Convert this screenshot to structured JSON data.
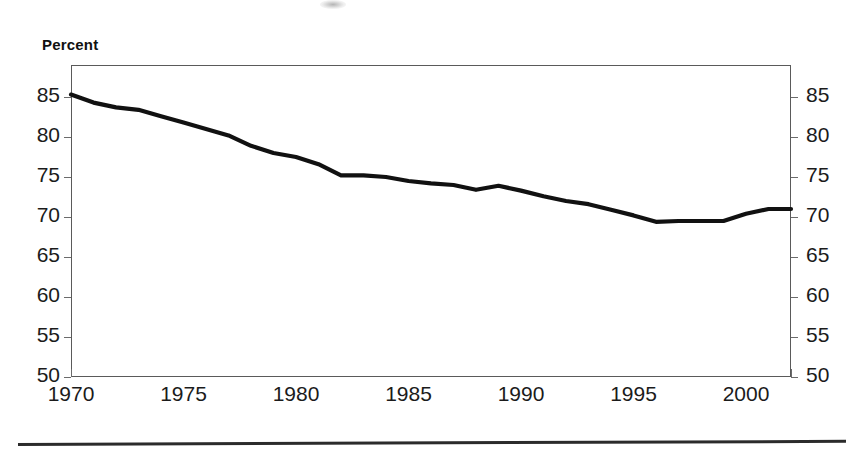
{
  "figure": {
    "axis_title": "Percent",
    "line_color": "#111111",
    "frame_color": "#5a5a5a"
  },
  "chart_data": {
    "type": "line",
    "title": "",
    "subtitle": "",
    "xlabel": "",
    "ylabel": "Percent",
    "xlim": [
      1970,
      2002
    ],
    "ylim": [
      50,
      85
    ],
    "grid": false,
    "legend": null,
    "y_tick_labels": [
      "85",
      "80",
      "75",
      "70",
      "65",
      "60",
      "55",
      "50"
    ],
    "y_ticks": [
      85,
      80,
      75,
      70,
      65,
      60,
      55,
      50
    ],
    "y_axis_right_mirrored": true,
    "x_tick_labels": [
      "1970",
      "1975",
      "1980",
      "1985",
      "1990",
      "1995",
      "2000"
    ],
    "x_ticks": [
      1970,
      1975,
      1980,
      1985,
      1990,
      1995,
      2000
    ],
    "series": [
      {
        "name": "Percent",
        "x": [
          1970,
          1971,
          1972,
          1973,
          1974,
          1975,
          1976,
          1977,
          1978,
          1979,
          1980,
          1981,
          1982,
          1983,
          1984,
          1985,
          1986,
          1987,
          1988,
          1989,
          1990,
          1991,
          1992,
          1993,
          1994,
          1995,
          1996,
          1997,
          1998,
          1999,
          2000,
          2001,
          2002
        ],
        "values": [
          85.3,
          84.3,
          83.7,
          83.4,
          82.6,
          81.8,
          81.0,
          80.2,
          78.9,
          78.0,
          77.5,
          76.6,
          75.2,
          75.2,
          75.0,
          74.5,
          74.2,
          74.0,
          73.4,
          73.9,
          73.3,
          72.6,
          72.0,
          71.6,
          70.9,
          70.2,
          69.4,
          69.5,
          69.5,
          69.5,
          70.4,
          71.0,
          71.0
        ]
      }
    ]
  }
}
